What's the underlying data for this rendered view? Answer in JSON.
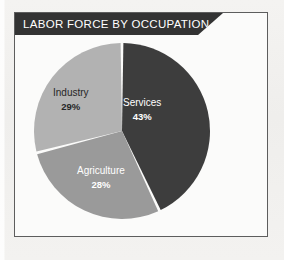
{
  "panel": {
    "title": "LABOR FORCE BY OCCUPATION"
  },
  "colors": {
    "services": "#3d3d3d",
    "industry": "#b2b2b2",
    "agriculture": "#9a9a9a",
    "banner_bg": "#333333",
    "banner_text": "#ffffff",
    "panel_bg": "#fbfbfa",
    "panel_border": "#5d5d5d",
    "page_bg": "#f2f1ef",
    "gap": "#ffffff"
  },
  "chart_data": {
    "type": "pie",
    "title": "LABOR FORCE BY OCCUPATION",
    "xlabel": "",
    "ylabel": "",
    "legend": "none",
    "grid": false,
    "start_angle_deg": 0,
    "direction": "clockwise",
    "unit": "%",
    "categories": [
      "Services",
      "Industry",
      "Agriculture"
    ],
    "values": [
      43,
      29,
      28
    ],
    "slices": [
      {
        "label": "Services",
        "value": 43,
        "value_text": "43%",
        "color": "#3d3d3d",
        "label_color": "#ffffff"
      },
      {
        "label": "Agriculture",
        "value": 28,
        "value_text": "28%",
        "color": "#9a9a9a",
        "label_color": "#ffffff"
      },
      {
        "label": "Industry",
        "value": 29,
        "value_text": "29%",
        "color": "#b2b2b2",
        "label_color": "#262626"
      }
    ]
  }
}
